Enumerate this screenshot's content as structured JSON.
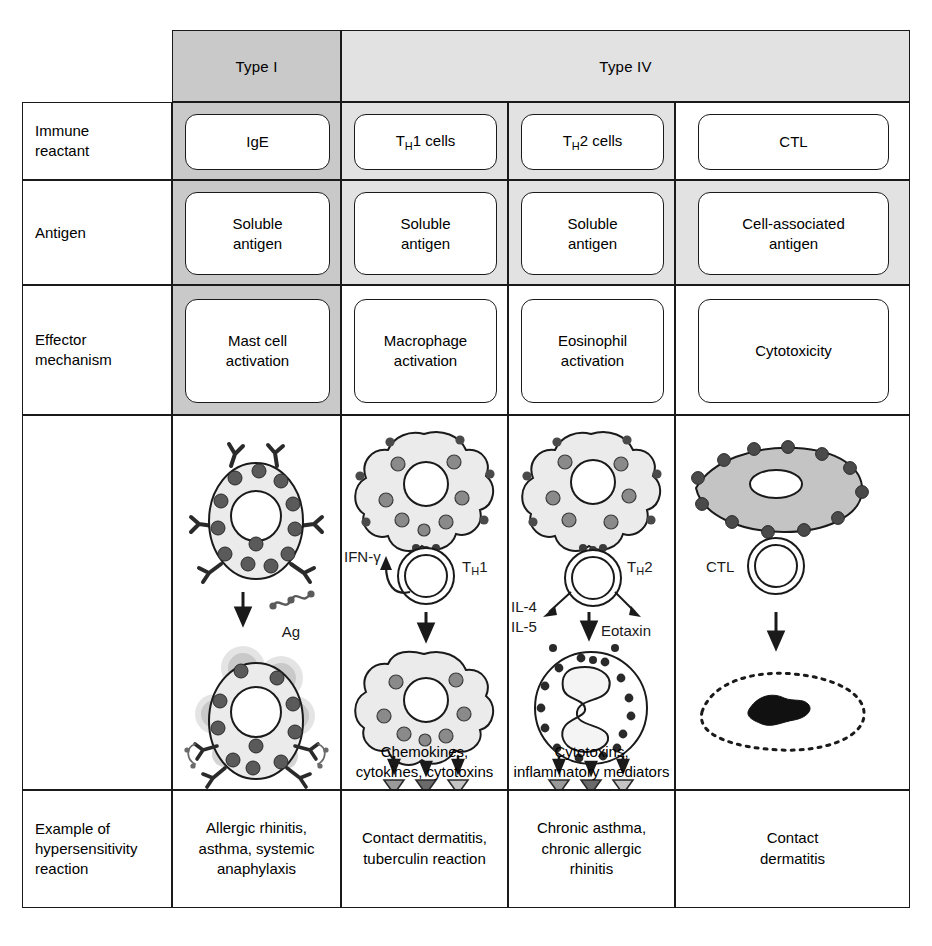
{
  "figure": {
    "title_row": {
      "type_i": "Type I",
      "type_iv": "Type IV"
    },
    "row_labels": {
      "immune_reactant": "Immune\nreactant",
      "antigen": "Antigen",
      "effector_mechanism": "Effector\nmechanism",
      "illustration": "",
      "example": "Example of\nhypersensitivity\nreaction"
    },
    "columns": [
      {
        "id": "type-i",
        "group": "Type I",
        "immune_reactant": "IgE",
        "antigen": "Soluble\nantigen",
        "effector_mechanism": "Mast cell\nactivation",
        "example": "Allergic rhinitis,\nasthma, systemic\nanaphylaxis"
      },
      {
        "id": "th1",
        "group": "Type IV",
        "immune_reactant": "TH1 cells",
        "antigen": "Soluble\nantigen",
        "effector_mechanism": "Macrophage\nactivation",
        "example": "Contact dermatitis,\ntuberculin reaction"
      },
      {
        "id": "th2",
        "group": "Type IV",
        "immune_reactant": "TH2 cells",
        "antigen": "Soluble\nantigen",
        "effector_mechanism": "Eosinophil\nactivation",
        "example": "Chronic asthma,\nchronic allergic\nrhinitis"
      },
      {
        "id": "ctl",
        "group": "Type IV",
        "immune_reactant": "CTL",
        "antigen": "Cell-associated\nantigen",
        "effector_mechanism": "Cytotoxicity",
        "example": "Contact\ndermatitis"
      }
    ],
    "illustration_labels": {
      "type_i": {
        "antigen": "Ag"
      },
      "th1": {
        "cytokine": "IFN-γ",
        "tcell": "TH1",
        "output": "Chemokines,\ncytokines, cytotoxins"
      },
      "th2": {
        "cytokine_left_1": "IL-4",
        "cytokine_left_2": "IL-5",
        "cytokine_right": "Eotaxin",
        "tcell": "TH2",
        "output": "Cytotoxins,\ninflammatory mediators"
      },
      "ctl": {
        "tcell": "CTL"
      }
    },
    "colors": {
      "line": "#1a1a1a",
      "header_type_i_fill": "#c9c9c9",
      "header_type_iv_fill": "#e2e2e2",
      "cell_fill": "#ffffff",
      "cytoplasm_fill": "#ebebeb",
      "granule_fill": "#5a5a5a"
    }
  }
}
